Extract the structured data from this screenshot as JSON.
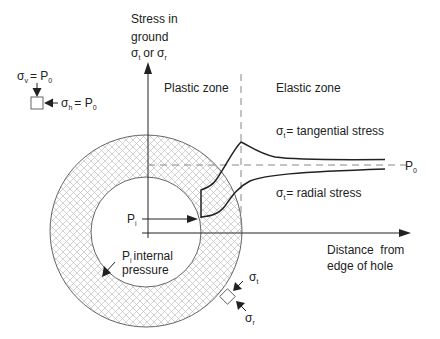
{
  "axes": {
    "y_label_lines": [
      "Stress in",
      "ground"
    ],
    "y_label_sigma": {
      "sym": "σ",
      "sub1": "t",
      "or": "or",
      "sub2": "r"
    },
    "x_label_lines": [
      "Distance  from",
      "edge of hole"
    ]
  },
  "zones": {
    "plastic": "Plastic zone",
    "elastic": "Elastic zone"
  },
  "curves": {
    "tangential": {
      "sym": "σ",
      "sub": "t",
      "text": "= tangential stress"
    },
    "radial": {
      "sym": "σ",
      "sub": "t",
      "text": "= radial stress"
    }
  },
  "reference_line": {
    "sym": "P",
    "sub": "0"
  },
  "internal_pressure": {
    "arrow_label": {
      "sym": "P",
      "sub": "i"
    },
    "desc": {
      "sym": "P",
      "sub": "i",
      "line1": "internal",
      "line2": "pressure"
    }
  },
  "field_stress": {
    "vertical": {
      "sym": "σ",
      "sub": "v",
      "eq": "= P",
      "eqsub": "0"
    },
    "horizontal": {
      "sym": "σ",
      "sub": "h",
      "eq": "= P",
      "eqsub": "0"
    }
  },
  "element_stress": {
    "tangential": {
      "sym": "σ",
      "sub": "t"
    },
    "radial": {
      "sym": "σ",
      "sub": "r"
    }
  },
  "colors": {
    "line": "#222222",
    "dash": "#888888",
    "hatch": "#b5b5b5"
  }
}
